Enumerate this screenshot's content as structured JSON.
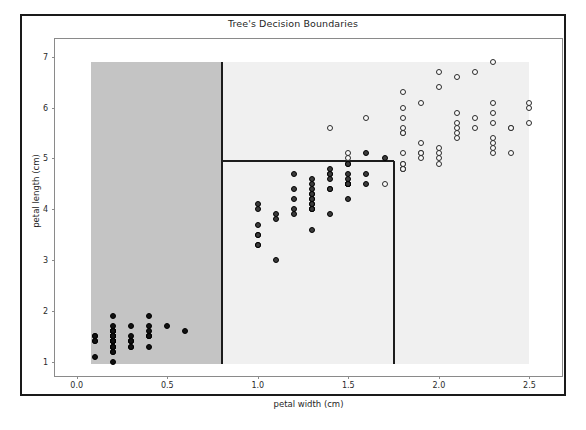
{
  "chart_data": {
    "type": "scatter",
    "title": "Tree's Decision Boundaries",
    "xlabel": "petal width (cm)",
    "ylabel": "petal length (cm)",
    "xlim": [
      -0.12,
      2.68
    ],
    "ylim": [
      0.72,
      7.35
    ],
    "xticks": [
      "0.0",
      "0.5",
      "1.0",
      "1.5",
      "2.0",
      "2.5"
    ],
    "xtick_values": [
      0.0,
      0.5,
      1.0,
      1.5,
      2.0,
      2.5
    ],
    "yticks": [
      "1",
      "2",
      "3",
      "4",
      "5",
      "6",
      "7"
    ],
    "ytick_values": [
      1,
      2,
      3,
      4,
      5,
      6,
      7
    ],
    "grid": false,
    "legend": "none",
    "decision_regions": [
      {
        "name": "setosa-region",
        "color": "#c4c4c4",
        "x_range": [
          0.08,
          0.8
        ],
        "y_range": [
          0.95,
          6.9
        ]
      },
      {
        "name": "versicolor-virginica-region",
        "color": "#f0f0f0",
        "x_range": [
          0.8,
          2.5
        ],
        "y_range": [
          0.95,
          6.9
        ]
      }
    ],
    "decision_boundaries": [
      {
        "name": "split-petal-width-0.8",
        "orientation": "vertical",
        "value": 0.8,
        "span": [
          0.95,
          6.9
        ]
      },
      {
        "name": "split-petal-length-4.95",
        "orientation": "horizontal",
        "value": 4.95,
        "span": [
          0.8,
          1.75
        ]
      },
      {
        "name": "split-petal-width-1.75",
        "orientation": "vertical",
        "value": 1.75,
        "span": [
          0.95,
          4.95
        ]
      }
    ],
    "series": [
      {
        "name": "setosa",
        "marker": "filled-dark-circle",
        "color": "#111111",
        "points": [
          [
            0.2,
            1.4
          ],
          [
            0.2,
            1.4
          ],
          [
            0.2,
            1.3
          ],
          [
            0.2,
            1.5
          ],
          [
            0.2,
            1.4
          ],
          [
            0.4,
            1.7
          ],
          [
            0.3,
            1.4
          ],
          [
            0.2,
            1.5
          ],
          [
            0.2,
            1.4
          ],
          [
            0.1,
            1.5
          ],
          [
            0.2,
            1.5
          ],
          [
            0.2,
            1.6
          ],
          [
            0.1,
            1.4
          ],
          [
            0.1,
            1.1
          ],
          [
            0.2,
            1.2
          ],
          [
            0.4,
            1.5
          ],
          [
            0.4,
            1.3
          ],
          [
            0.3,
            1.4
          ],
          [
            0.3,
            1.7
          ],
          [
            0.3,
            1.5
          ],
          [
            0.2,
            1.7
          ],
          [
            0.4,
            1.5
          ],
          [
            0.2,
            1.0
          ],
          [
            0.5,
            1.7
          ],
          [
            0.2,
            1.9
          ],
          [
            0.2,
            1.6
          ],
          [
            0.4,
            1.6
          ],
          [
            0.2,
            1.5
          ],
          [
            0.2,
            1.4
          ],
          [
            0.2,
            1.6
          ],
          [
            0.2,
            1.6
          ],
          [
            0.4,
            1.5
          ],
          [
            0.1,
            1.5
          ],
          [
            0.2,
            1.4
          ],
          [
            0.2,
            1.5
          ],
          [
            0.2,
            1.2
          ],
          [
            0.2,
            1.3
          ],
          [
            0.1,
            1.4
          ],
          [
            0.2,
            1.3
          ],
          [
            0.2,
            1.5
          ],
          [
            0.3,
            1.3
          ],
          [
            0.3,
            1.3
          ],
          [
            0.2,
            1.3
          ],
          [
            0.6,
            1.6
          ],
          [
            0.4,
            1.9
          ],
          [
            0.3,
            1.4
          ],
          [
            0.2,
            1.6
          ],
          [
            0.2,
            1.4
          ],
          [
            0.2,
            1.5
          ],
          [
            0.2,
            1.4
          ]
        ]
      },
      {
        "name": "versicolor",
        "marker": "filled-gray-circle",
        "color": "#3b3b3b",
        "points": [
          [
            1.4,
            4.7
          ],
          [
            1.5,
            4.5
          ],
          [
            1.5,
            4.9
          ],
          [
            1.3,
            4.0
          ],
          [
            1.5,
            4.6
          ],
          [
            1.3,
            4.5
          ],
          [
            1.6,
            4.7
          ],
          [
            1.0,
            3.3
          ],
          [
            1.3,
            4.6
          ],
          [
            1.4,
            3.9
          ],
          [
            1.0,
            3.5
          ],
          [
            1.5,
            4.2
          ],
          [
            1.0,
            4.0
          ],
          [
            1.4,
            4.7
          ],
          [
            1.3,
            3.6
          ],
          [
            1.4,
            4.4
          ],
          [
            1.5,
            4.5
          ],
          [
            1.0,
            4.1
          ],
          [
            1.5,
            4.5
          ],
          [
            1.1,
            3.9
          ],
          [
            1.8,
            4.8
          ],
          [
            1.3,
            4.0
          ],
          [
            1.5,
            4.9
          ],
          [
            1.2,
            4.7
          ],
          [
            1.3,
            4.3
          ],
          [
            1.4,
            4.4
          ],
          [
            1.4,
            4.8
          ],
          [
            1.7,
            5.0
          ],
          [
            1.5,
            4.5
          ],
          [
            1.0,
            3.5
          ],
          [
            1.1,
            3.8
          ],
          [
            1.0,
            3.7
          ],
          [
            1.2,
            3.9
          ],
          [
            1.6,
            5.1
          ],
          [
            1.5,
            4.5
          ],
          [
            1.6,
            4.5
          ],
          [
            1.5,
            4.7
          ],
          [
            1.3,
            4.4
          ],
          [
            1.3,
            4.1
          ],
          [
            1.3,
            4.0
          ],
          [
            1.2,
            4.4
          ],
          [
            1.4,
            4.6
          ],
          [
            1.2,
            4.0
          ],
          [
            1.0,
            3.3
          ],
          [
            1.3,
            4.2
          ],
          [
            1.2,
            4.2
          ],
          [
            1.3,
            4.2
          ],
          [
            1.3,
            4.3
          ],
          [
            1.1,
            3.0
          ],
          [
            1.3,
            4.1
          ]
        ]
      },
      {
        "name": "virginica",
        "marker": "hollow-circle",
        "color": "#fbfbfb",
        "points": [
          [
            2.5,
            6.0
          ],
          [
            1.9,
            5.1
          ],
          [
            2.1,
            5.9
          ],
          [
            1.8,
            5.6
          ],
          [
            2.2,
            5.8
          ],
          [
            2.1,
            6.6
          ],
          [
            1.7,
            4.5
          ],
          [
            1.8,
            6.3
          ],
          [
            1.8,
            5.8
          ],
          [
            2.5,
            6.1
          ],
          [
            2.0,
            5.1
          ],
          [
            1.9,
            5.3
          ],
          [
            2.1,
            5.5
          ],
          [
            2.0,
            5.0
          ],
          [
            2.4,
            5.1
          ],
          [
            2.3,
            5.3
          ],
          [
            1.8,
            5.5
          ],
          [
            2.2,
            6.7
          ],
          [
            2.3,
            6.9
          ],
          [
            1.5,
            5.0
          ],
          [
            2.3,
            5.7
          ],
          [
            2.0,
            4.9
          ],
          [
            2.0,
            6.7
          ],
          [
            1.8,
            4.9
          ],
          [
            2.1,
            5.7
          ],
          [
            1.8,
            6.0
          ],
          [
            1.8,
            4.8
          ],
          [
            1.8,
            4.9
          ],
          [
            2.1,
            5.6
          ],
          [
            1.6,
            5.8
          ],
          [
            1.9,
            6.1
          ],
          [
            2.0,
            6.4
          ],
          [
            2.2,
            5.6
          ],
          [
            1.5,
            5.1
          ],
          [
            1.4,
            5.6
          ],
          [
            2.3,
            6.1
          ],
          [
            2.4,
            5.6
          ],
          [
            1.8,
            5.5
          ],
          [
            1.8,
            4.8
          ],
          [
            2.1,
            5.4
          ],
          [
            2.4,
            5.6
          ],
          [
            2.3,
            5.1
          ],
          [
            1.9,
            5.1
          ],
          [
            2.3,
            5.9
          ],
          [
            2.5,
            5.7
          ],
          [
            2.3,
            5.2
          ],
          [
            1.9,
            5.0
          ],
          [
            2.0,
            5.2
          ],
          [
            2.3,
            5.4
          ],
          [
            1.8,
            5.1
          ]
        ]
      }
    ]
  }
}
